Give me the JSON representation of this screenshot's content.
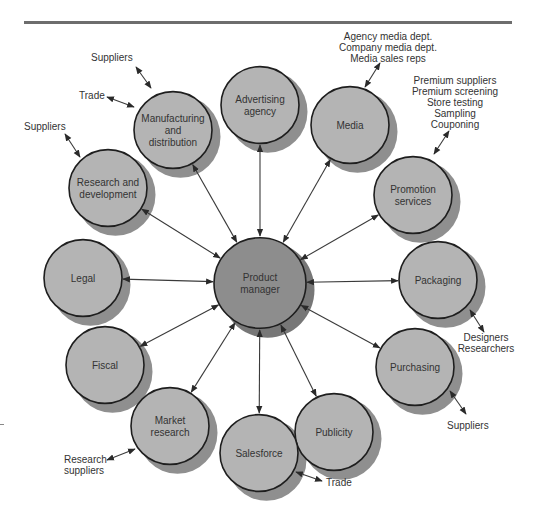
{
  "colors": {
    "node_fill": "#b4b4b4",
    "node_shadow": "#8f8f8f",
    "center_fill": "#8d8d8d",
    "center_shadow": "#777777",
    "stroke": "#1e1e1e",
    "arrow": "#3a3a3a",
    "text": "#333333",
    "rule": "#6d6d6d"
  },
  "center": {
    "id": "product-manager",
    "label": [
      "Product",
      "manager"
    ],
    "x": 260,
    "y": 283,
    "r": 46
  },
  "nodes": [
    {
      "id": "advertising-agency",
      "label": [
        "Advertising",
        "agency"
      ],
      "x": 260,
      "y": 105
    },
    {
      "id": "manufacturing-and-distribution",
      "label": [
        "Manufacturing",
        "and",
        "distribution"
      ],
      "x": 173,
      "y": 130
    },
    {
      "id": "media",
      "label": [
        "Media"
      ],
      "x": 350,
      "y": 125
    },
    {
      "id": "research-and-development",
      "label": [
        "Research and",
        "development"
      ],
      "x": 108,
      "y": 188
    },
    {
      "id": "promotion-services",
      "label": [
        "Promotion",
        "services"
      ],
      "x": 413,
      "y": 195
    },
    {
      "id": "legal",
      "label": [
        "Legal"
      ],
      "x": 83,
      "y": 278
    },
    {
      "id": "packaging",
      "label": [
        "Packaging"
      ],
      "x": 438,
      "y": 280
    },
    {
      "id": "fiscal",
      "label": [
        "Fiscal"
      ],
      "x": 105,
      "y": 365
    },
    {
      "id": "purchasing",
      "label": [
        "Purchasing"
      ],
      "x": 415,
      "y": 367
    },
    {
      "id": "market-research",
      "label": [
        "Market",
        "research"
      ],
      "x": 170,
      "y": 426
    },
    {
      "id": "publicity",
      "label": [
        "Publicity"
      ],
      "x": 334,
      "y": 432
    },
    {
      "id": "salesforce",
      "label": [
        "Salesforce"
      ],
      "x": 259,
      "y": 453
    }
  ],
  "node_radius": 39,
  "shadow_offset": [
    10,
    9
  ],
  "external": [
    {
      "id": "mfg-suppliers",
      "node": "manufacturing-and-distribution",
      "lines": [
        "Suppliers"
      ],
      "tx": 91,
      "ty": 61,
      "anchor": "start",
      "ax1": 136,
      "ay1": 67,
      "ax2": 151,
      "ay2": 88
    },
    {
      "id": "mfg-trade",
      "node": "manufacturing-and-distribution",
      "lines": [
        "Trade"
      ],
      "tx": 79,
      "ty": 99,
      "anchor": "start",
      "ax1": 107,
      "ay1": 97,
      "ax2": 134,
      "ay2": 107
    },
    {
      "id": "rd-suppliers",
      "node": "research-and-development",
      "lines": [
        "Suppliers"
      ],
      "tx": 24,
      "ty": 130,
      "anchor": "start",
      "ax1": 65,
      "ay1": 134,
      "ax2": 80,
      "ay2": 157
    },
    {
      "id": "media-contacts",
      "node": "media",
      "lines": [
        "Agency media dept.",
        "Company media dept.",
        "Media sales reps"
      ],
      "tx": 388,
      "ty": 40,
      "anchor": "middle",
      "ax1": 380,
      "ay1": 63,
      "ax2": 365,
      "ay2": 87
    },
    {
      "id": "promotion-contacts",
      "node": "promotion-services",
      "lines": [
        "Premium suppliers",
        "Premium screening",
        "Store testing",
        "Sampling",
        "Couponing"
      ],
      "tx": 455,
      "ty": 84,
      "anchor": "middle",
      "ax1": 449,
      "ay1": 131,
      "ax2": 434,
      "ay2": 154
    },
    {
      "id": "packaging-contacts",
      "node": "packaging",
      "lines": [
        "Designers",
        "Researchers"
      ],
      "tx": 486,
      "ty": 341,
      "anchor": "middle",
      "ax1": 470,
      "ay1": 310,
      "ax2": 484,
      "ay2": 332
    },
    {
      "id": "purchasing-suppliers",
      "node": "purchasing",
      "lines": [
        "Suppliers"
      ],
      "tx": 447,
      "ty": 429,
      "anchor": "start",
      "ax1": 450,
      "ay1": 391,
      "ax2": 466,
      "ay2": 414
    },
    {
      "id": "market-research-suppliers",
      "node": "market-research",
      "lines": [
        "Research",
        "suppliers"
      ],
      "tx": 64,
      "ty": 463,
      "anchor": "start",
      "ax1": 107,
      "ay1": 460,
      "ax2": 135,
      "ay2": 449
    },
    {
      "id": "salesforce-trade",
      "node": "salesforce",
      "lines": [
        "Trade"
      ],
      "tx": 326,
      "ty": 486,
      "anchor": "start",
      "ax1": 296,
      "ay1": 472,
      "ax2": 322,
      "ay2": 481
    }
  ]
}
